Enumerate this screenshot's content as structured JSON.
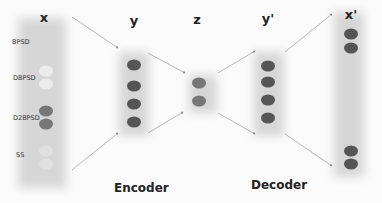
{
  "layers": {
    "x": {
      "title": "x"
    },
    "y": {
      "title": "y"
    },
    "z": {
      "title": "z"
    },
    "y_prime": {
      "title": "y'"
    },
    "x_prime": {
      "title": "x'"
    }
  },
  "input_groups": [
    {
      "label": "BPSD",
      "fill": "none"
    },
    {
      "label": "DBPSD",
      "fill": "light"
    },
    {
      "label": "D2BPSD",
      "fill": "dark"
    },
    {
      "label": "SS",
      "fill": "pale"
    }
  ],
  "captions": {
    "encoder": "Encoder",
    "decoder": "Decoder"
  },
  "colors": {
    "node_dark": "#555555",
    "node_light": "#ececec",
    "panel": "#d6d6d6",
    "arrow": "#888888"
  }
}
